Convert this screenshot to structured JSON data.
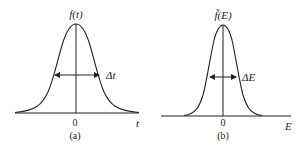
{
  "panels": [
    {
      "id": "a",
      "function_label": "f(t)",
      "width_label": "Δt",
      "origin_label": "0",
      "axis_label": "t",
      "caption": "(a)",
      "description": "Broad Gaussian in time domain"
    },
    {
      "id": "b",
      "function_label": "f̃(E)",
      "width_label": "ΔE",
      "origin_label": "0",
      "axis_label": "E",
      "caption": "(b)",
      "description": "Narrow Gaussian in energy domain"
    }
  ],
  "colors": {
    "stroke": "#222222",
    "background": "#ffffff"
  }
}
